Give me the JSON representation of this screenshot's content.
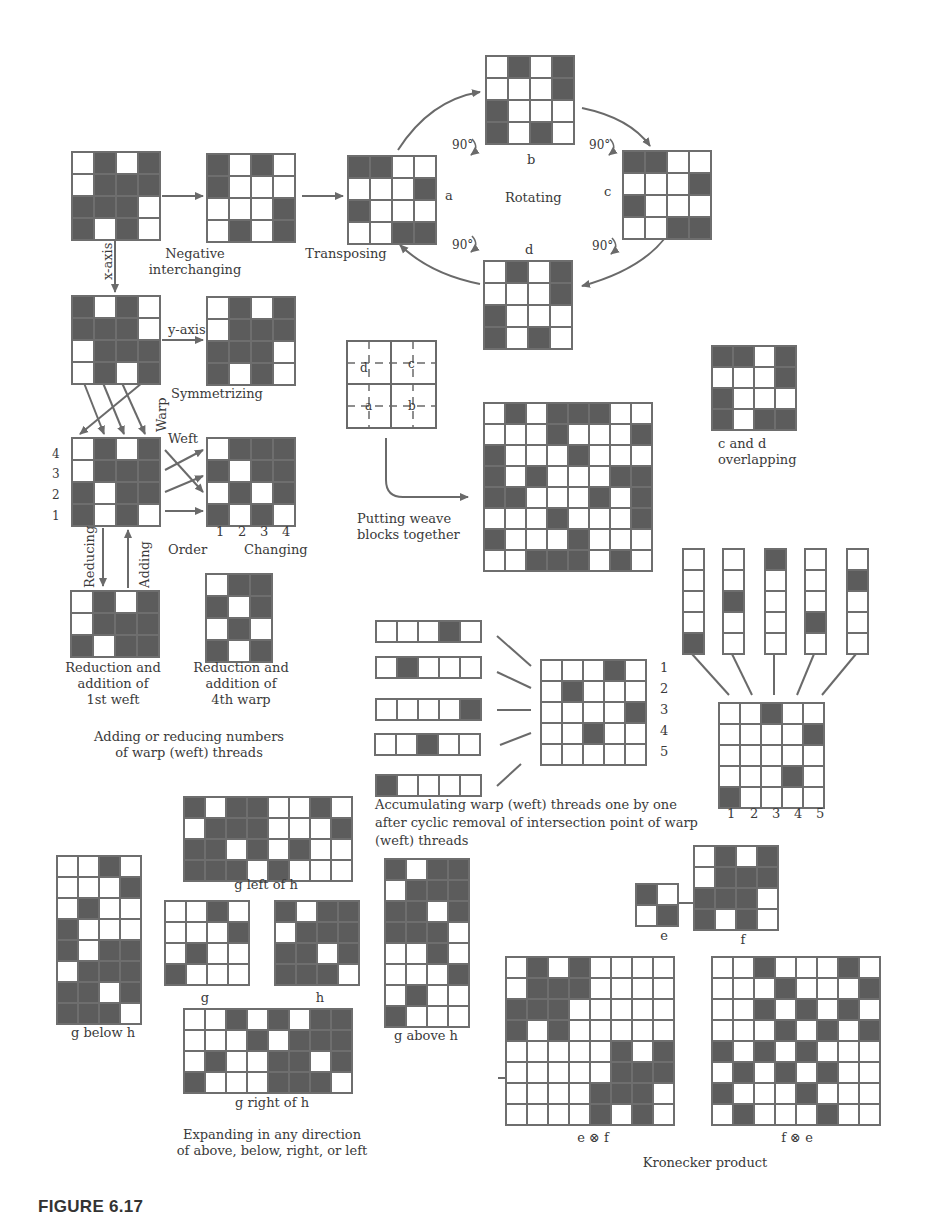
{
  "figure": {
    "caption": "FIGURE 6.17"
  },
  "labels": {
    "negative": "Negative\ninterchanging",
    "transposing": "Transposing",
    "rotating": "Rotating",
    "a": "a",
    "b": "b",
    "c": "c",
    "d": "d",
    "deg": "90°",
    "x_axis": "x-axis",
    "y_axis": "y-axis",
    "symmetrizing": "Symmetrizing",
    "warp": "Warp",
    "weft": "Weft",
    "order": "Order",
    "changing": "Changing",
    "reducing": "Reducing",
    "adding": "Adding",
    "red_1st_weft": "Reduction and\naddition of\n1st weft",
    "red_4th_warp": "Reduction and\naddition of\n4th warp",
    "adding_reducing": "Adding or reducing numbers\nof warp (weft) threads",
    "putting_together": "Putting weave\nblocks together",
    "c_and_d": "c and d\noverlapping",
    "accumulating": "Accumulating warp (weft) threads one by one\nafter cyclic removal of intersection point of warp\n(weft) threads",
    "g_left_of_h": "g left of h",
    "g_below_h": "g below h",
    "g": "g",
    "h": "h",
    "g_above_h": "g above h",
    "g_right_of_h": "g right of h",
    "expanding": "Expanding in any direction\nof above, below, right, or left",
    "e": "e",
    "f": "f",
    "e_kron_f": "e ⊗ f",
    "f_kron_e": "f ⊗ e",
    "kronecker": "Kronecker product",
    "order_rows": [
      "4",
      "3",
      "2",
      "1"
    ],
    "order_cols": [
      "1",
      "2",
      "3",
      "4"
    ],
    "acc_rows": [
      "1",
      "2",
      "3",
      "4",
      "5"
    ],
    "acc_cols": [
      "1",
      "2",
      "3",
      "4",
      "5"
    ],
    "quad": {
      "d": "d",
      "c": "c",
      "a": "a",
      "b": "b"
    }
  },
  "grids": {
    "original": {
      "x": 71,
      "y": 151,
      "cell": 20,
      "rows": [
        "WDWD",
        "WDDD",
        "DDDW",
        "DWDW"
      ]
    },
    "negative": {
      "x": 206,
      "y": 153,
      "cell": 20,
      "rows": [
        "DWDW",
        "DWWW",
        "WWWD",
        "WDWD"
      ]
    },
    "transposed_a": {
      "x": 347,
      "y": 155,
      "cell": 20,
      "rows": [
        "DDWW",
        "WWWD",
        "DWWW",
        "WWDD"
      ]
    },
    "rot_b": {
      "x": 485,
      "y": 55,
      "cell": 20,
      "rows": [
        "WDWD",
        "WWWD",
        "DWWW",
        "DWDW"
      ]
    },
    "rot_c": {
      "x": 622,
      "y": 150,
      "cell": 20,
      "rows": [
        "DDWW",
        "WWWD",
        "DWWW",
        "WWDD"
      ]
    },
    "rot_d": {
      "x": 483,
      "y": 260,
      "cell": 20,
      "rows": [
        "WDWD",
        "WWWD",
        "DWWW",
        "DWDW"
      ]
    },
    "x_axis": {
      "x": 71,
      "y": 295,
      "cell": 20,
      "rows": [
        "DWDW",
        "DDDW",
        "WDDD",
        "WDWD"
      ]
    },
    "y_axis": {
      "x": 206,
      "y": 296,
      "cell": 20,
      "rows": [
        "WDWD",
        "WDDD",
        "DDDW",
        "DWDW"
      ]
    },
    "order_src": {
      "x": 71,
      "y": 437,
      "cell": 20,
      "rows": [
        "WDWD",
        "WDDD",
        "DWDD",
        "DWDW"
      ]
    },
    "order_changed": {
      "x": 206,
      "y": 437,
      "cell": 20,
      "rows": [
        "WDDD",
        "DWDD",
        "WDWD",
        "DWDW"
      ]
    },
    "reduced_weft": {
      "x": 70,
      "y": 590,
      "cell": 20,
      "rows": [
        "WDWD",
        "WDDD",
        "DWDD"
      ]
    },
    "reduced_warp": {
      "x": 205,
      "y": 573,
      "cell": 20,
      "rows": [
        "WDD",
        "DWD",
        "WDW",
        "DWD"
      ]
    },
    "combined_8x8": {
      "x": 483,
      "y": 402,
      "cell": 19,
      "rows": [
        "WDWDDDWW",
        "WWWDWWWD",
        "DWWWDWWW",
        "DWDWWWDD",
        "DDWWWDWD",
        "WWWDWWWD",
        "DWWWDWWW",
        "WWDDDWDW"
      ]
    },
    "overlap_cd": {
      "x": 711,
      "y": 345,
      "cell": 19,
      "rows": [
        "DDWD",
        "WWWD",
        "DWWW",
        "DWDD"
      ]
    },
    "weft_1": {
      "x": 375,
      "y": 620,
      "cell": 19,
      "rows": [
        "WWWDW"
      ]
    },
    "weft_2": {
      "x": 375,
      "y": 656,
      "cell": 19,
      "rows": [
        "WDWWW"
      ]
    },
    "weft_3": {
      "x": 375,
      "y": 698,
      "cell": 19,
      "rows": [
        "WWWWD"
      ]
    },
    "weft_4": {
      "x": 374,
      "y": 733,
      "cell": 19,
      "rows": [
        "WWDWW"
      ]
    },
    "weft_5": {
      "x": 375,
      "y": 774,
      "cell": 19,
      "rows": [
        "DWWWW"
      ]
    },
    "acc_weft_5x5": {
      "x": 540,
      "y": 659,
      "cell": 19,
      "rows": [
        "WWWDW",
        "WDWWW",
        "WWWWD",
        "WWDWW",
        "WWWWW"
      ]
    },
    "warp_1": {
      "x": 682,
      "y": 548,
      "cell": 19,
      "cols": "WWWWD"
    },
    "warp_2": {
      "x": 722,
      "y": 548,
      "cell": 19,
      "cols": "WWDWW"
    },
    "warp_3": {
      "x": 764,
      "y": 548,
      "cell": 19,
      "cols": "DWWWW"
    },
    "warp_4": {
      "x": 804,
      "y": 548,
      "cell": 19,
      "cols": "WWWDW"
    },
    "warp_5": {
      "x": 846,
      "y": 548,
      "cell": 19,
      "cols": "WDWWW"
    },
    "acc_warp_5x5": {
      "x": 718,
      "y": 702,
      "cell": 19,
      "rows": [
        "WWDWW",
        "WWWWD",
        "WWWWW",
        "WWWDW",
        "DWWWW"
      ]
    },
    "g_left_of_h": {
      "x": 183,
      "y": 796,
      "cell": 19,
      "rows": [
        "DWDDWWDW",
        "WDDDWWWD",
        "DDWDWDWW",
        "DDDWDWWW"
      ]
    },
    "g_below_h": {
      "x": 56,
      "y": 855,
      "cell": 19,
      "rows": [
        "WWDW",
        "WWWD",
        "WDWW",
        "DWWW",
        "DWDD",
        "WDDD",
        "DDWD",
        "DDDW"
      ]
    },
    "g": {
      "x": 164,
      "y": 900,
      "cell": 19,
      "rows": [
        "WWDW",
        "WWWD",
        "WDWW",
        "DWWW"
      ]
    },
    "h": {
      "x": 274,
      "y": 900,
      "cell": 19,
      "rows": [
        "DWDD",
        "WDDD",
        "DDWD",
        "DDDW"
      ]
    },
    "g_above_h": {
      "x": 384,
      "y": 858,
      "cell": 19,
      "rows": [
        "DWDD",
        "WDDD",
        "DDWD",
        "DDDW",
        "WWDW",
        "WWWD",
        "WDWW",
        "DWWW"
      ]
    },
    "g_right_of_h": {
      "x": 183,
      "y": 1008,
      "cell": 19,
      "rows": [
        "WWDWDWDD",
        "WWWDWDDD",
        "WDWWDDWD",
        "DWWWDDDW"
      ]
    },
    "e": {
      "x": 635,
      "y": 883,
      "cell": 19,
      "rows": [
        "DW",
        "WD"
      ]
    },
    "f": {
      "x": 693,
      "y": 845,
      "cell": 19,
      "rows": [
        "WDWD",
        "WDDD",
        "DDDW",
        "DWDW"
      ]
    },
    "e_kron_f": {
      "x": 505,
      "y": 956,
      "cell": 19,
      "rows": [
        "WDWDWWWW",
        "WDDDWWWW",
        "DDDWWWWW",
        "DWDWWWWW",
        "WWWWWDWD",
        "WWWWWDDD",
        "WWWWDDDW",
        "WWWWDWDW"
      ]
    },
    "f_kron_e": {
      "x": 711,
      "y": 956,
      "cell": 19,
      "rows": [
        "WWDWWWDW",
        "WWWDWWWD",
        "WWDWDWDW",
        "WWWDWDWD",
        "DWDWDWWW",
        "WDWDWDWW",
        "DWWWDWWW",
        "WDWWWDWW"
      ]
    }
  },
  "colors": {
    "dark_cell": "#5c5c5c",
    "light_cell": "#ffffff",
    "grid_line": "#6e6e6e",
    "arrow": "#6a6a6a",
    "text": "#3a3a3a"
  }
}
